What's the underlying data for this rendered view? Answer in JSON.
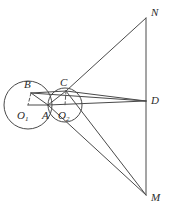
{
  "figure": {
    "background_color": "#ffffff",
    "stroke_color": "#4a4a4a",
    "label_color": "#2b2b2b",
    "width": 170,
    "height": 217
  },
  "labels": {
    "N": "N",
    "M": "M",
    "D": "D",
    "B": "B",
    "C": "C",
    "A": "A",
    "O1_base": "O",
    "O1_sub": "1",
    "O2_base": "O",
    "O2_sub": "2"
  },
  "geometry": {
    "points": {
      "N": {
        "x": 146,
        "y": 18
      },
      "D": {
        "x": 146,
        "y": 101
      },
      "M": {
        "x": 146,
        "y": 195
      },
      "B": {
        "x": 31,
        "y": 93
      },
      "C": {
        "x": 66,
        "y": 91
      },
      "A": {
        "x": 48,
        "y": 105
      },
      "O1": {
        "x": 28,
        "y": 105
      },
      "O2": {
        "x": 65,
        "y": 105
      },
      "P": {
        "x": 103,
        "y": 152
      }
    },
    "circles": [
      {
        "name": "circle-O1",
        "cx": 28,
        "cy": 105,
        "r": 24
      },
      {
        "name": "circle-O2",
        "cx": 65,
        "cy": 105,
        "r": 17
      }
    ],
    "solid_segments": [
      {
        "name": "segment-ND",
        "from": "N",
        "to": "D"
      },
      {
        "name": "segment-DM",
        "from": "D",
        "to": "M"
      },
      {
        "name": "segment-CN",
        "from": "C",
        "to": "N"
      },
      {
        "name": "segment-CD",
        "from": "C",
        "to": "D"
      },
      {
        "name": "segment-BD",
        "from": "B",
        "to": "D"
      },
      {
        "name": "segment-BC",
        "from": "B",
        "to": "C"
      },
      {
        "name": "segment-O1A",
        "from": "O1",
        "to": "A"
      },
      {
        "name": "segment-AD",
        "from": "A",
        "to": "D"
      },
      {
        "name": "segment-AB",
        "from": "A",
        "to": "B"
      },
      {
        "name": "segment-AC",
        "from": "A",
        "to": "C"
      },
      {
        "name": "segment-AM",
        "from": "A",
        "to": "M"
      },
      {
        "name": "segment-CM",
        "from": "C",
        "to": "M"
      }
    ],
    "dashed_segments": [
      {
        "name": "segment-BO1-dashed",
        "from": "B",
        "to": "O1"
      },
      {
        "name": "segment-CO2-dashed",
        "from": "C",
        "to": "O2"
      }
    ]
  },
  "label_positions": {
    "N": {
      "x": 151,
      "y": 7
    },
    "D": {
      "x": 151,
      "y": 95
    },
    "M": {
      "x": 151,
      "y": 192
    },
    "B": {
      "x": 24,
      "y": 79
    },
    "C": {
      "x": 60,
      "y": 77
    },
    "A": {
      "x": 42,
      "y": 110
    },
    "O1": {
      "x": 17,
      "y": 110
    },
    "O2": {
      "x": 58,
      "y": 110
    }
  }
}
